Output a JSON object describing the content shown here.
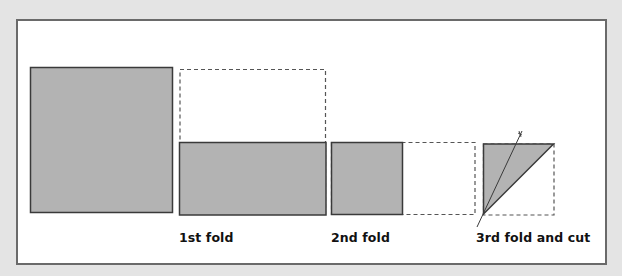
{
  "diagram": {
    "colors": {
      "background": "#e4e4e4",
      "frame_fill": "#ffffff",
      "frame_border": "#6a6a6a",
      "paper_fill": "#b3b3b3",
      "paper_stroke": "#3a3a3a",
      "dashed_stroke": "#555555",
      "label_text": "#111111"
    },
    "steps": [
      {
        "id": "original",
        "label": "",
        "shape": "square",
        "description": "Unfolded square sheet of paper"
      },
      {
        "id": "fold-1",
        "label": "1st fold",
        "shape": "rectangle",
        "description": "Top half folded down onto bottom half; dashed outline shows original square"
      },
      {
        "id": "fold-2",
        "label": "2nd fold",
        "shape": "square",
        "description": "Right half folded onto left half; dashed outline shows previous rectangle"
      },
      {
        "id": "fold-3-cut",
        "label": "3rd fold and cut",
        "shape": "triangle",
        "description": "Folded diagonally into a triangle; a straight cut line crosses it"
      }
    ]
  }
}
